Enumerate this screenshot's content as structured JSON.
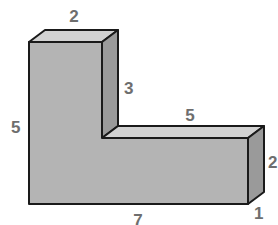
{
  "diagram": {
    "type": "3d-l-shaped-prism",
    "colors": {
      "front": "#b4b4b4",
      "top": "#d2d2d2",
      "side": "#9a9a9a",
      "edge": "#1a1a1a",
      "label": "#6e6e6e"
    },
    "labels": {
      "top_width": "2",
      "inner_vertical": "3",
      "inner_horizontal": "5",
      "left_height": "5",
      "right_height": "2",
      "depth": "1",
      "bottom_length": "7"
    }
  }
}
